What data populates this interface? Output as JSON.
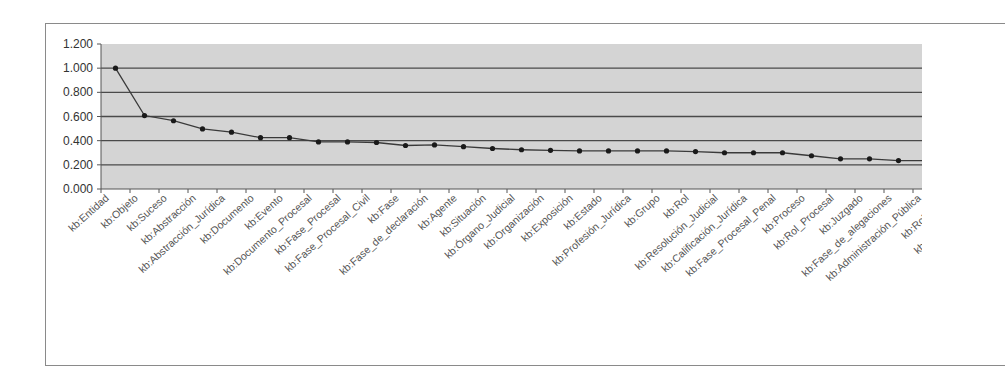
{
  "chart_data": {
    "type": "line",
    "title": "",
    "xlabel": "",
    "ylabel": "",
    "ylim": [
      0,
      1.2
    ],
    "yticks": [
      "0.000",
      "0.200",
      "0.400",
      "0.600",
      "0.800",
      "1.000",
      "1.200"
    ],
    "grid": true,
    "legend": null,
    "categories": [
      "kb:Entidad",
      "kb:Objeto",
      "kb:Suceso",
      "kb:Abstracción",
      "kb:Abstracción_Jurídica",
      "kb:Documento",
      "kb:Evento",
      "kb:Documento_Procesal",
      "kb:Fase_Procesal",
      "kb:Fase_Procesal_Civil",
      "kb:Fase",
      "kb:Fase_de_declaración",
      "kb:Agente",
      "kb:Situación",
      "kb:Órgano_Judicial",
      "kb:Organización",
      "kb:Exposición",
      "kb:Estado",
      "kb:Profesión_Jurídica",
      "kb:Grupo",
      "kb:Rol",
      "kb:Resolución_Judicial",
      "kb:Calificación_Jurídica",
      "kb:Fase_Procesal_Penal",
      "kb:Proceso",
      "kb:Rol_Procesal",
      "kb:Juzgado",
      "kb:Fase_de_alegaciones",
      "kb:Administración_Pública"
    ],
    "clipped_labels": [
      "kb:Rol_Profe",
      "kb:Administración"
    ],
    "series": [
      {
        "name": "",
        "values": [
          1.0,
          0.608,
          0.565,
          0.497,
          0.47,
          0.425,
          0.425,
          0.39,
          0.39,
          0.385,
          0.36,
          0.365,
          0.35,
          0.335,
          0.325,
          0.32,
          0.315,
          0.315,
          0.315,
          0.315,
          0.31,
          0.3,
          0.3,
          0.3,
          0.275,
          0.25,
          0.25,
          0.235,
          0.235
        ]
      }
    ]
  },
  "colors": {
    "plot_background": "#d4d4d4",
    "gridline": "#4a4a4a",
    "line": "#3a3a3a",
    "marker": "#1a1a1a",
    "frame": "#8a8a8a"
  }
}
